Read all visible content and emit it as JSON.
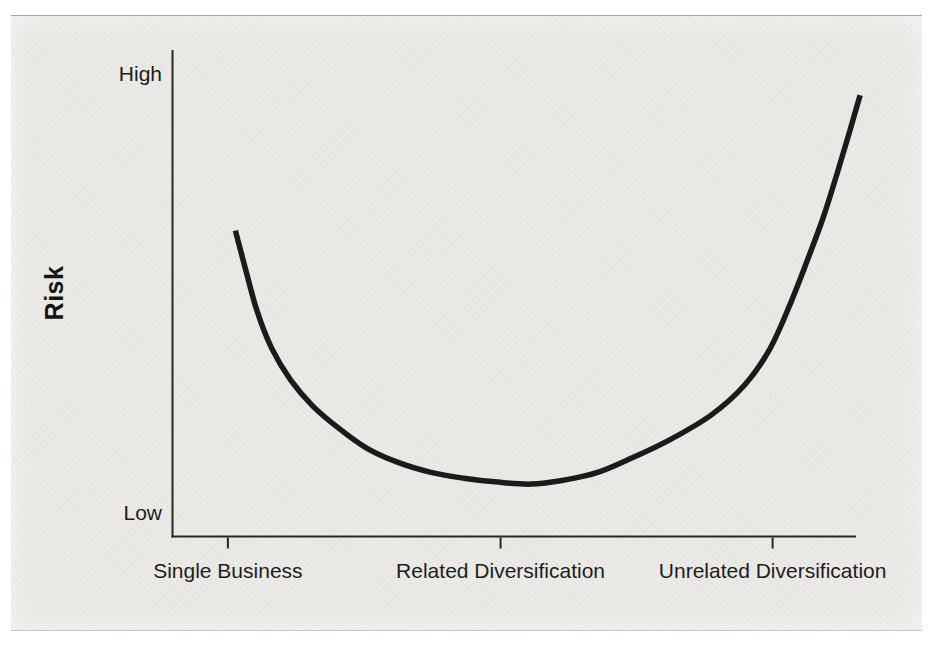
{
  "figure": {
    "y_axis": {
      "label": "Risk",
      "top_tick_label": "High",
      "bottom_tick_label": "Low"
    },
    "x_axis": {
      "categories": [
        "Single Business",
        "Related Diversification",
        "Unrelated Diversification"
      ]
    }
  },
  "chart_data": {
    "type": "line",
    "title": "",
    "ylabel": "Risk",
    "y_scale": "qualitative",
    "y_tick_labels": [
      "Low",
      "High"
    ],
    "x_categories": [
      "Single Business",
      "Related Diversification",
      "Unrelated Diversification"
    ],
    "x_tick_fractions": [
      0.081,
      0.48,
      0.878
    ],
    "grid": false,
    "legend": false,
    "series": [
      {
        "name": "Risk",
        "shape": "asymmetric U-curve",
        "points": [
          [
            0.092,
            0.63
          ],
          [
            0.107,
            0.55
          ],
          [
            0.124,
            0.463
          ],
          [
            0.145,
            0.388
          ],
          [
            0.173,
            0.322
          ],
          [
            0.205,
            0.269
          ],
          [
            0.243,
            0.223
          ],
          [
            0.284,
            0.182
          ],
          [
            0.329,
            0.153
          ],
          [
            0.378,
            0.132
          ],
          [
            0.426,
            0.12
          ],
          [
            0.476,
            0.112
          ],
          [
            0.524,
            0.108
          ],
          [
            0.572,
            0.116
          ],
          [
            0.622,
            0.132
          ],
          [
            0.671,
            0.161
          ],
          [
            0.726,
            0.198
          ],
          [
            0.788,
            0.25
          ],
          [
            0.837,
            0.312
          ],
          [
            0.873,
            0.384
          ],
          [
            0.902,
            0.473
          ],
          [
            0.928,
            0.566
          ],
          [
            0.952,
            0.657
          ],
          [
            0.972,
            0.746
          ],
          [
            0.99,
            0.831
          ],
          [
            1.006,
            0.909
          ]
        ]
      }
    ],
    "reading": {
      "Single Business": "moderately high risk (~0.63 of axis height)",
      "Related Diversification": "lowest risk (~0.11 of axis height)",
      "Unrelated Diversification": "highest risk (~0.91 of axis height)"
    },
    "colors": {
      "curve": "#1b1b1b",
      "axis": "#262626",
      "text": "#1d1d1d",
      "panel": "#ebeae7",
      "page": "#ffffff"
    }
  }
}
